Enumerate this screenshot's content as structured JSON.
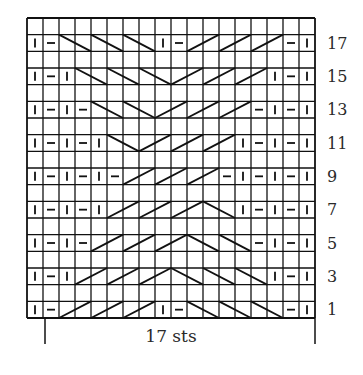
{
  "chart": {
    "columns": 18,
    "rows": 18,
    "repeat_label": "17 sts",
    "repeat_start_col": 1,
    "repeat_end_col": 18,
    "colors": {
      "line": "#111111",
      "text": "#2a2a2a",
      "background": "#ffffff"
    },
    "legend_symbols": {
      "|": "knit",
      "-": "purl",
      "\\": "2-st left-leaning cable/cross",
      "/": "2-st right-leaning cable/cross"
    },
    "row_labels": [
      "17",
      "15",
      "13",
      "11",
      "9",
      "7",
      "5",
      "3",
      "1"
    ],
    "chart_rows": [
      {
        "row": 18,
        "cells": []
      },
      {
        "row": 17,
        "cells": [
          "|",
          "-",
          "\\\\",
          "\\\\",
          "\\\\",
          "|",
          "-",
          "//",
          "//",
          "//",
          "-",
          "|"
        ]
      },
      {
        "row": 16,
        "cells": []
      },
      {
        "row": 15,
        "cells": [
          "|",
          "-",
          "|",
          "\\\\",
          "\\\\",
          "\\\\",
          "//",
          "//",
          "//",
          "|",
          "-",
          "|"
        ]
      },
      {
        "row": 14,
        "cells": []
      },
      {
        "row": 13,
        "cells": [
          "|",
          "-",
          "|",
          "-",
          "\\\\",
          "\\\\",
          "//",
          "//",
          "//",
          "-",
          "|",
          "-",
          "|"
        ]
      },
      {
        "row": 12,
        "cells": []
      },
      {
        "row": 11,
        "cells": [
          "|",
          "-",
          "|",
          "-",
          "|",
          "\\\\",
          "//",
          "//",
          "//",
          "|",
          "-",
          "|",
          "-",
          "|"
        ]
      },
      {
        "row": 10,
        "cells": []
      },
      {
        "row": 9,
        "cells": [
          "|",
          "-",
          "|",
          "-",
          "|",
          "-",
          "//",
          "//",
          "//",
          "-",
          "|",
          "-",
          "|",
          "-",
          "|"
        ]
      },
      {
        "row": 8,
        "cells": []
      },
      {
        "row": 7,
        "cells": [
          "|",
          "-",
          "|",
          "-",
          "|",
          "//",
          "//",
          "//",
          "\\\\",
          "|",
          "-",
          "|",
          "-",
          "|"
        ]
      },
      {
        "row": 6,
        "cells": []
      },
      {
        "row": 5,
        "cells": [
          "|",
          "-",
          "|",
          "-",
          "//",
          "//",
          "//",
          "\\\\",
          "\\\\",
          "-",
          "|",
          "-",
          "|"
        ]
      },
      {
        "row": 4,
        "cells": []
      },
      {
        "row": 3,
        "cells": [
          "|",
          "-",
          "|",
          "//",
          "//",
          "//",
          "\\\\",
          "\\\\",
          "\\\\",
          "|",
          "-",
          "|"
        ]
      },
      {
        "row": 2,
        "cells": []
      },
      {
        "row": 1,
        "cells": [
          "|",
          "-",
          "//",
          "//",
          "//",
          "|",
          "-",
          "\\\\",
          "\\\\",
          "\\\\",
          "-",
          "|"
        ]
      }
    ]
  }
}
